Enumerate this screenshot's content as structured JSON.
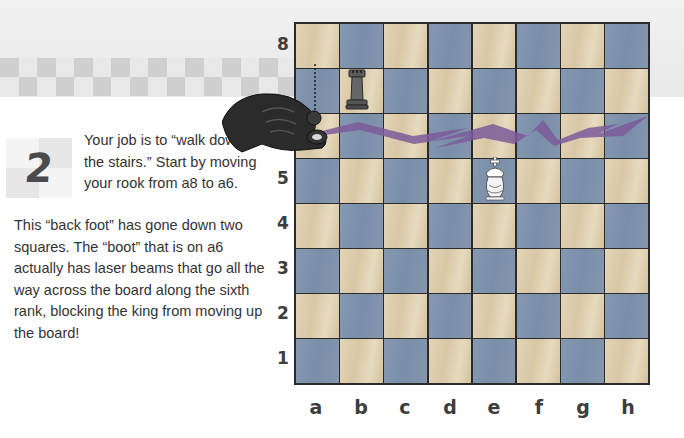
{
  "step": {
    "number": "2",
    "intro": "Your job is to “walk down the stairs.” Start by moving your rook from a8 to a6.",
    "body": "This “back foot” has gone down two squares. The “boot” that is on a6 actually has laser beams that go all the way across the board along the sixth rank, blocking the king from moving up the board!"
  },
  "board": {
    "ranks": [
      "8",
      "5",
      "4",
      "3",
      "2",
      "1"
    ],
    "files": [
      "a",
      "b",
      "c",
      "d",
      "e",
      "f",
      "g",
      "h"
    ],
    "colors": {
      "light": "#dccca9",
      "dark": "#7f93ad",
      "laser": "#7b5b9a"
    },
    "pieces": [
      {
        "type": "rook",
        "color": "black",
        "square": "b7"
      },
      {
        "type": "king",
        "color": "white",
        "square": "e5"
      },
      {
        "type": "rook",
        "color": "black",
        "square": "a6",
        "held_by_hand": true
      }
    ],
    "annotations": [
      {
        "type": "dashed-arrow",
        "from": "a8",
        "to": "a6"
      },
      {
        "type": "laser-beam",
        "rank": "6",
        "from": "a6",
        "to": "h6"
      }
    ]
  }
}
